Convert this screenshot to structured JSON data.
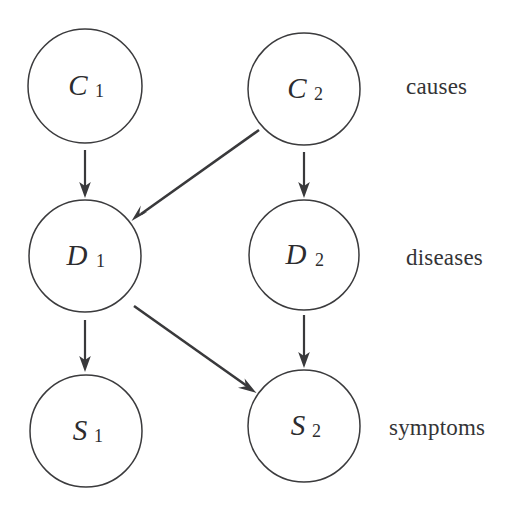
{
  "diagram": {
    "background_color": "#ffffff",
    "stroke_color": "#39393b",
    "node_fill": "#ffffff",
    "nodes": [
      {
        "id": "C1",
        "base": "C",
        "sub": "1",
        "cx": 85,
        "cy": 86,
        "r": 57,
        "layer": "causes"
      },
      {
        "id": "C2",
        "base": "C",
        "sub": "2",
        "cx": 304,
        "cy": 89,
        "r": 56,
        "layer": "causes"
      },
      {
        "id": "D1",
        "base": "D",
        "sub": "1",
        "cx": 85,
        "cy": 256,
        "r": 56,
        "layer": "diseases"
      },
      {
        "id": "D2",
        "base": "D",
        "sub": "2",
        "cx": 304,
        "cy": 255,
        "r": 55,
        "layer": "diseases"
      },
      {
        "id": "S1",
        "base": "S",
        "sub": "1",
        "cx": 86,
        "cy": 431,
        "r": 56,
        "layer": "symptoms"
      },
      {
        "id": "S2",
        "base": "S",
        "sub": "2",
        "cx": 304,
        "cy": 426,
        "r": 56,
        "layer": "symptoms"
      }
    ],
    "edges": [
      {
        "id": "C1-D1",
        "from": "C1",
        "to": "D1",
        "kind": "vertical",
        "x1": 85,
        "y1": 150,
        "x2": 85,
        "y2": 196
      },
      {
        "id": "C2-D1",
        "from": "C2",
        "to": "D1",
        "kind": "diagonal",
        "x1": 259,
        "y1": 130,
        "x2": 133,
        "y2": 220
      },
      {
        "id": "C2-D2",
        "from": "C2",
        "to": "D2",
        "kind": "vertical",
        "x1": 304,
        "y1": 152,
        "x2": 304,
        "y2": 196
      },
      {
        "id": "D1-S1",
        "from": "D1",
        "to": "S1",
        "kind": "vertical",
        "x1": 85,
        "y1": 320,
        "x2": 85,
        "y2": 370
      },
      {
        "id": "D1-S2",
        "from": "D1",
        "to": "S2",
        "kind": "diagonal",
        "x1": 134,
        "y1": 306,
        "x2": 256,
        "y2": 393
      },
      {
        "id": "D2-S2",
        "from": "D2",
        "to": "S2",
        "kind": "vertical",
        "x1": 304,
        "y1": 315,
        "x2": 304,
        "y2": 366
      }
    ],
    "row_labels": [
      {
        "id": "causes",
        "text": "causes",
        "x": 406,
        "y": 74
      },
      {
        "id": "diseases",
        "text": "diseases",
        "x": 406,
        "y": 245
      },
      {
        "id": "symptoms",
        "text": "symptoms",
        "x": 389,
        "y": 415
      }
    ]
  }
}
